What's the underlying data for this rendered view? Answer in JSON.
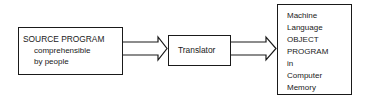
{
  "diagram": {
    "source": {
      "title": "SOURCE PROGRAM",
      "line2": "comprehensible",
      "line3": "by people"
    },
    "translator": {
      "label": "Translator"
    },
    "object": {
      "lines": [
        "Machine",
        "Language",
        "OBJECT",
        "PROGRAM",
        "in",
        "Computer",
        "Memory"
      ]
    },
    "arrows": [
      {
        "from": "source",
        "to": "translator",
        "style": "hollow-double-line"
      },
      {
        "from": "translator",
        "to": "object",
        "style": "hollow-double-line"
      }
    ],
    "colors": {
      "line": "#1a1a1a",
      "background": "#ffffff"
    }
  }
}
